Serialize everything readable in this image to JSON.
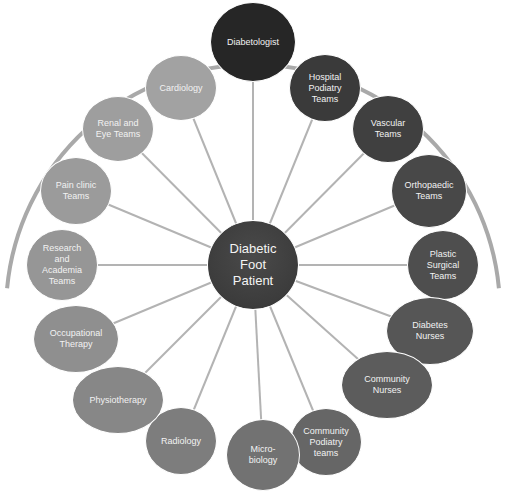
{
  "diagram": {
    "center": {
      "label": "Diabetic\nFoot\nPatient",
      "x": 253,
      "y": 265,
      "rx": 46,
      "ry": 45,
      "color": "#3c3c3c"
    },
    "arc": {
      "cx": 253,
      "cy": 265,
      "r": 247,
      "color": "#a9a9a9",
      "width": 4
    },
    "connector_color": "#b3b3b3",
    "nodes": [
      {
        "id": "diabetologist",
        "label": "Diabetologist",
        "x": 253,
        "y": 42,
        "rx": 43,
        "ry": 40,
        "color": "#262626"
      },
      {
        "id": "hospital-podiatry",
        "label": "Hospital\nPodiatry\nTeams",
        "x": 325,
        "y": 88,
        "rx": 36,
        "ry": 34,
        "color": "#3a3a3a"
      },
      {
        "id": "vascular",
        "label": "Vascular\nTeams",
        "x": 388,
        "y": 129,
        "rx": 36,
        "ry": 34,
        "color": "#404040"
      },
      {
        "id": "orthopaedic",
        "label": "Orthopaedic\nTeams",
        "x": 429,
        "y": 191,
        "rx": 38,
        "ry": 37,
        "color": "#484848"
      },
      {
        "id": "plastic-surgical",
        "label": "Plastic\nSurgical\nTeams",
        "x": 443,
        "y": 265,
        "rx": 36,
        "ry": 35,
        "color": "#4e4e4e"
      },
      {
        "id": "diabetes-nurses",
        "label": "Diabetes\nNurses",
        "x": 430,
        "y": 331,
        "rx": 44,
        "ry": 34,
        "color": "#565656"
      },
      {
        "id": "community-nurses",
        "label": "Community\nNurses",
        "x": 387,
        "y": 385,
        "rx": 46,
        "ry": 34,
        "color": "#5c5c5c"
      },
      {
        "id": "community-podiatry",
        "label": "Community\nPodiatry\nteams",
        "x": 326,
        "y": 442,
        "rx": 36,
        "ry": 34,
        "color": "#666666"
      },
      {
        "id": "microbiology",
        "label": "Micro-\nbiology",
        "x": 263,
        "y": 455,
        "rx": 37,
        "ry": 36,
        "color": "#727272"
      },
      {
        "id": "radiology",
        "label": "Radiology",
        "x": 181,
        "y": 441,
        "rx": 36,
        "ry": 34,
        "color": "#7d7d7d"
      },
      {
        "id": "physiotherapy",
        "label": "Physiotherapy",
        "x": 118,
        "y": 400,
        "rx": 46,
        "ry": 34,
        "color": "#878787"
      },
      {
        "id": "occupational-therapy",
        "label": "Occupational\nTherapy",
        "x": 76,
        "y": 339,
        "rx": 43,
        "ry": 34,
        "color": "#8f8f8f"
      },
      {
        "id": "research-academia",
        "label": "Research\nand\nAcademia\nTeams",
        "x": 62,
        "y": 265,
        "rx": 36,
        "ry": 36,
        "color": "#969696"
      },
      {
        "id": "pain-clinic",
        "label": "Pain clinic\nTeams",
        "x": 76,
        "y": 191,
        "rx": 36,
        "ry": 34,
        "color": "#9b9b9b"
      },
      {
        "id": "renal-eye",
        "label": "Renal and\nEye Teams",
        "x": 118,
        "y": 129,
        "rx": 36,
        "ry": 33,
        "color": "#9e9e9e"
      },
      {
        "id": "cardiology",
        "label": "Cardiology",
        "x": 181,
        "y": 88,
        "rx": 36,
        "ry": 33,
        "color": "#a2a2a2"
      }
    ]
  }
}
